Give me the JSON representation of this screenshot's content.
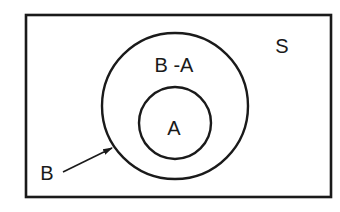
{
  "diagram": {
    "type": "venn",
    "universe": {
      "label": "S"
    },
    "sets": [
      {
        "id": "B",
        "label": "B",
        "region_label": "B -A",
        "contains": "A"
      },
      {
        "id": "A",
        "label": "A"
      }
    ],
    "pointer": {
      "label": "B",
      "target": "outer-circle"
    },
    "colors": {
      "stroke": "#1a1a1a",
      "background": "#ffffff"
    }
  }
}
